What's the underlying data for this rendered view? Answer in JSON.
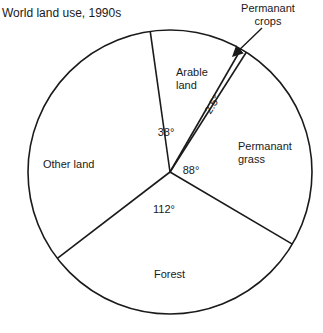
{
  "chart_data": {
    "type": "pie",
    "title": "World land use, 1990s",
    "units": "degrees",
    "start_angle_deg": -8,
    "slices": [
      {
        "label": "Arable land",
        "value": 38,
        "value_label": "38°"
      },
      {
        "label": "Permanant crops",
        "value": 2.5,
        "value_label": "2.5°"
      },
      {
        "label": "Permanant grass",
        "value": 88,
        "value_label": "88°"
      },
      {
        "label": "Forest",
        "value": 112,
        "value_label": "112°"
      },
      {
        "label": "Other land",
        "value": 119.5,
        "value_label": ""
      }
    ]
  }
}
